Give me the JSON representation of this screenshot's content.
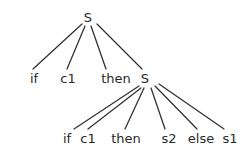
{
  "diagram": {
    "type": "parse-tree",
    "colors": {
      "line": "#333333",
      "text": "#2a2a2a",
      "background": "#ffffff"
    },
    "nodes": [
      {
        "id": "S_root",
        "label": "S",
        "x": 88,
        "y": 22
      },
      {
        "id": "if_1",
        "label": "if",
        "x": 34,
        "y": 83
      },
      {
        "id": "c1_1",
        "label": "c1",
        "x": 68,
        "y": 83
      },
      {
        "id": "then_1",
        "label": "then",
        "x": 116,
        "y": 83
      },
      {
        "id": "S_inner",
        "label": "S",
        "x": 145,
        "y": 83
      },
      {
        "id": "if_2",
        "label": "if",
        "x": 67,
        "y": 143
      },
      {
        "id": "c1_2",
        "label": "c1",
        "x": 88,
        "y": 143
      },
      {
        "id": "then_2",
        "label": "then",
        "x": 126,
        "y": 143
      },
      {
        "id": "s2",
        "label": "s2",
        "x": 169,
        "y": 143
      },
      {
        "id": "else",
        "label": "else",
        "x": 201,
        "y": 143
      },
      {
        "id": "s1",
        "label": "s1",
        "x": 230,
        "y": 143
      }
    ],
    "edges": [
      {
        "from": "S_root",
        "to": "if_1",
        "x1": 82,
        "y1": 24,
        "x2": 33,
        "y2": 69
      },
      {
        "from": "S_root",
        "to": "c1_1",
        "x1": 85,
        "y1": 26,
        "x2": 67,
        "y2": 69
      },
      {
        "from": "S_root",
        "to": "then_1",
        "x1": 91,
        "y1": 26,
        "x2": 106,
        "y2": 69
      },
      {
        "from": "S_root",
        "to": "S_inner",
        "x1": 97,
        "y1": 24,
        "x2": 142,
        "y2": 69
      },
      {
        "from": "S_inner",
        "to": "if_2",
        "x1": 139,
        "y1": 86,
        "x2": 74,
        "y2": 129
      },
      {
        "from": "S_inner",
        "to": "c1_2",
        "x1": 141,
        "y1": 88,
        "x2": 88,
        "y2": 129
      },
      {
        "from": "S_inner",
        "to": "then_2",
        "x1": 144,
        "y1": 88,
        "x2": 125,
        "y2": 129
      },
      {
        "from": "S_inner",
        "to": "s2",
        "x1": 151,
        "y1": 88,
        "x2": 165,
        "y2": 129
      },
      {
        "from": "S_inner",
        "to": "else",
        "x1": 155,
        "y1": 86,
        "x2": 197,
        "y2": 129
      },
      {
        "from": "S_inner",
        "to": "s1",
        "x1": 159,
        "y1": 84,
        "x2": 224,
        "y2": 129
      }
    ]
  }
}
